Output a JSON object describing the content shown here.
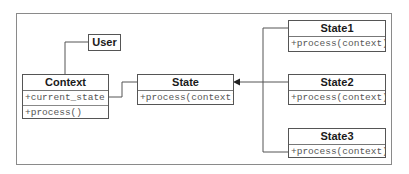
{
  "diagram": {
    "type": "UML class diagram (State pattern)",
    "classes": {
      "user": {
        "name": "User"
      },
      "context": {
        "name": "Context",
        "attributes": [
          "+current_state"
        ],
        "methods": [
          "+process()"
        ]
      },
      "state": {
        "name": "State",
        "methods": [
          "+process(context)"
        ]
      },
      "state1": {
        "name": "State1",
        "methods": [
          "+process(context)"
        ]
      },
      "state2": {
        "name": "State2",
        "methods": [
          "+process(context)"
        ]
      },
      "state3": {
        "name": "State3",
        "methods": [
          "+process(context)"
        ]
      }
    },
    "relationships": [
      {
        "from": "User",
        "to": "Context",
        "kind": "association"
      },
      {
        "from": "Context",
        "to": "State",
        "kind": "association",
        "via": "+current_state"
      },
      {
        "from": "State1",
        "to": "State",
        "kind": "generalization"
      },
      {
        "from": "State2",
        "to": "State",
        "kind": "generalization"
      },
      {
        "from": "State3",
        "to": "State",
        "kind": "generalization"
      }
    ],
    "colors": {
      "line": "#555555",
      "frame": "#8a8a8a",
      "text": "#1a1a1a",
      "member_text": "#555555"
    }
  }
}
